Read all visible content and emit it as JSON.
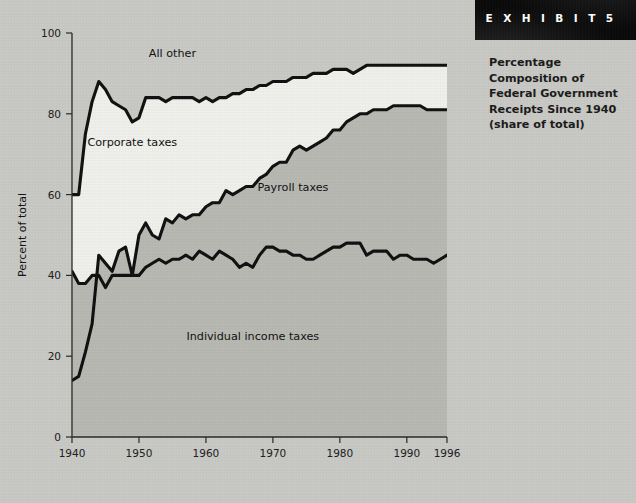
{
  "banner": {
    "label": "E X H I B I T   5"
  },
  "caption": {
    "line1": "Percentage",
    "line2": "Composition of",
    "line3": "Federal Government",
    "line4": "Receipts Since 1940",
    "line5": "(share of total)"
  },
  "colors": {
    "page_background": "#c9c9c5",
    "banner_background": "#0b0b0b",
    "band_all_other": "#c9c9c5",
    "band_corporate": "#f0f0ec",
    "band_payroll": "#b9b9b4",
    "band_individual": "#b9b9b4",
    "curve_stroke": "#111111",
    "axis": "#2a2a2a"
  },
  "chart_data": {
    "type": "area",
    "title": "Percentage Composition of Federal Government Receipts Since 1940 (share of total)",
    "xlabel": "",
    "ylabel": "Percent of total",
    "xlim": [
      1940,
      1996
    ],
    "ylim": [
      0,
      100
    ],
    "grid": false,
    "legend": "inline-annotations",
    "xticks": [
      1940,
      1950,
      1960,
      1970,
      1980,
      1990,
      1996
    ],
    "yticks": [
      0,
      20,
      40,
      60,
      80,
      100
    ],
    "annotations": [
      {
        "text": "All other",
        "x": 1955,
        "y": 94
      },
      {
        "text": "Corporate taxes",
        "x": 1949,
        "y": 72
      },
      {
        "text": "Payroll taxes",
        "x": 1973,
        "y": 61
      },
      {
        "text": "Individual income taxes",
        "x": 1967,
        "y": 24
      }
    ],
    "x": [
      1940,
      1941,
      1942,
      1943,
      1944,
      1945,
      1946,
      1947,
      1948,
      1949,
      1950,
      1951,
      1952,
      1953,
      1954,
      1955,
      1956,
      1957,
      1958,
      1959,
      1960,
      1961,
      1962,
      1963,
      1964,
      1965,
      1966,
      1967,
      1968,
      1969,
      1970,
      1971,
      1972,
      1973,
      1974,
      1975,
      1976,
      1977,
      1978,
      1979,
      1980,
      1981,
      1982,
      1983,
      1984,
      1985,
      1986,
      1987,
      1988,
      1989,
      1990,
      1991,
      1992,
      1993,
      1994,
      1995,
      1996
    ],
    "series": [
      {
        "name": "Individual income taxes (cumulative lower boundary)",
        "description": "Bottom curve: cumulative share of individual income taxes",
        "values": [
          14,
          15,
          21,
          28,
          45,
          43,
          41,
          46,
          47,
          40,
          40,
          42,
          43,
          44,
          43,
          44,
          44,
          45,
          44,
          46,
          45,
          44,
          46,
          45,
          44,
          42,
          43,
          42,
          45,
          47,
          47,
          46,
          46,
          45,
          45,
          44,
          44,
          45,
          46,
          47,
          47,
          48,
          48,
          48,
          45,
          46,
          46,
          46,
          44,
          45,
          45,
          44,
          44,
          44,
          43,
          44,
          45
        ]
      },
      {
        "name": "Payroll taxes (cumulative boundary, individual + payroll)",
        "description": "Middle curve: cumulative share of individual income + payroll taxes",
        "values": [
          41,
          38,
          38,
          40,
          40,
          37,
          40,
          40,
          40,
          40,
          50,
          53,
          50,
          49,
          54,
          53,
          55,
          54,
          55,
          55,
          57,
          58,
          58,
          61,
          60,
          61,
          62,
          62,
          64,
          65,
          67,
          68,
          68,
          71,
          72,
          71,
          72,
          73,
          74,
          76,
          76,
          78,
          79,
          80,
          80,
          81,
          81,
          81,
          82,
          82,
          82,
          82,
          82,
          81,
          81,
          81,
          81
        ]
      },
      {
        "name": "Corporate taxes (cumulative boundary, individual + payroll + corporate)",
        "description": "Top curve: cumulative share before 'All other'",
        "values": [
          60,
          60,
          75,
          83,
          88,
          86,
          83,
          82,
          81,
          78,
          79,
          84,
          84,
          84,
          83,
          84,
          84,
          84,
          84,
          83,
          84,
          83,
          84,
          84,
          85,
          85,
          86,
          86,
          87,
          87,
          88,
          88,
          88,
          89,
          89,
          89,
          90,
          90,
          90,
          91,
          91,
          91,
          90,
          91,
          92,
          92,
          92,
          92,
          92,
          92,
          92,
          92,
          92,
          92,
          92,
          92,
          92
        ]
      }
    ],
    "bands": [
      {
        "name": "Individual income taxes",
        "from": "baseline",
        "to": "Individual income taxes (cumulative lower boundary)"
      },
      {
        "name": "Payroll taxes",
        "from": "Individual income taxes (cumulative lower boundary)",
        "to": "Payroll taxes (cumulative boundary, individual + payroll)"
      },
      {
        "name": "Corporate taxes",
        "from": "Payroll taxes (cumulative boundary, individual + payroll)",
        "to": "Corporate taxes (cumulative boundary, individual + payroll + corporate)"
      },
      {
        "name": "All other",
        "from": "Corporate taxes (cumulative boundary, individual + payroll + corporate)",
        "to": "100"
      }
    ]
  }
}
